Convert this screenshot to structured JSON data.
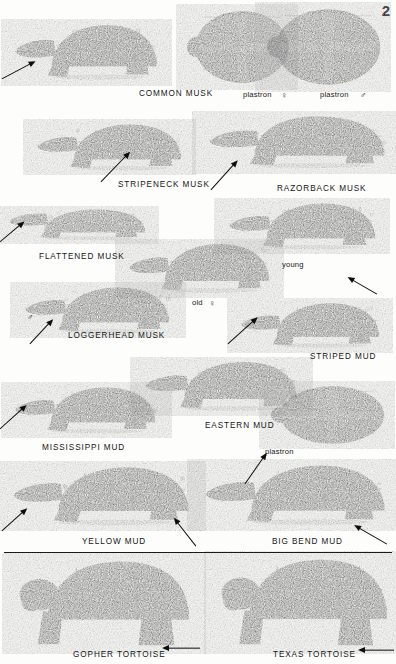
{
  "plate": {
    "page_number": "2",
    "background_color": "#fdfdfb",
    "ink_color": "#161616",
    "divider_color": "#1a1a1a"
  },
  "labels": [
    {
      "id": "common-musk",
      "text": "COMMON MUSK",
      "x": 139,
      "y": 89,
      "kind": "species"
    },
    {
      "id": "plastron-female-1",
      "text": "plastron",
      "x": 243,
      "y": 90,
      "kind": "minor"
    },
    {
      "id": "symbol-female-1",
      "text": "♀",
      "x": 281,
      "y": 90,
      "kind": "symbol"
    },
    {
      "id": "plastron-male-1",
      "text": "plastron",
      "x": 320,
      "y": 90,
      "kind": "minor"
    },
    {
      "id": "symbol-male-1",
      "text": "♂",
      "x": 360,
      "y": 90,
      "kind": "symbol"
    },
    {
      "id": "stripeneck-musk",
      "text": "STRIPENECK MUSK",
      "x": 118,
      "y": 180,
      "kind": "species"
    },
    {
      "id": "razorback-musk",
      "text": "RAZORBACK MUSK",
      "x": 277,
      "y": 184,
      "kind": "species"
    },
    {
      "id": "flattened-musk",
      "text": "FLATTENED MUSK",
      "x": 39,
      "y": 252,
      "kind": "species"
    },
    {
      "id": "young",
      "text": "young",
      "x": 282,
      "y": 260,
      "kind": "minor"
    },
    {
      "id": "symbol-male-2",
      "text": "♂",
      "x": 27,
      "y": 312,
      "kind": "symbol"
    },
    {
      "id": "old-female",
      "text": "old",
      "x": 192,
      "y": 298,
      "kind": "minor"
    },
    {
      "id": "symbol-female-2",
      "text": "♀",
      "x": 209,
      "y": 298,
      "kind": "symbol"
    },
    {
      "id": "loggerhead-musk",
      "text": "LOGGERHEAD MUSK",
      "x": 68,
      "y": 331,
      "kind": "species"
    },
    {
      "id": "striped-mud",
      "text": "STRIPED MUD",
      "x": 310,
      "y": 352,
      "kind": "species"
    },
    {
      "id": "eastern-mud",
      "text": "EASTERN MUD",
      "x": 205,
      "y": 421,
      "kind": "species"
    },
    {
      "id": "mississippi-mud",
      "text": "MISSISSIPPI MUD",
      "x": 42,
      "y": 443,
      "kind": "species"
    },
    {
      "id": "plastron-2",
      "text": "plastron",
      "x": 265,
      "y": 447,
      "kind": "minor"
    },
    {
      "id": "yellow-mud",
      "text": "YELLOW MUD",
      "x": 82,
      "y": 537,
      "kind": "species"
    },
    {
      "id": "big-bend-mud",
      "text": "BIG BEND MUD",
      "x": 272,
      "y": 537,
      "kind": "species"
    },
    {
      "id": "gopher-tortoise",
      "text": "GOPHER TORTOISE",
      "x": 73,
      "y": 650,
      "kind": "species"
    },
    {
      "id": "texas-tortoise",
      "text": "TEXAS TORTOISE",
      "x": 273,
      "y": 650,
      "kind": "species"
    }
  ],
  "divider": {
    "y": 552
  },
  "arrows": [
    {
      "id": "arrow-common-musk-head",
      "x": 2,
      "y": 75,
      "len": 38,
      "angle": -28
    },
    {
      "id": "arrow-stripeneck-neck",
      "x": 101,
      "y": 178,
      "len": 42,
      "angle": -46
    },
    {
      "id": "arrow-razorback-head",
      "x": 211,
      "y": 186,
      "len": 40,
      "angle": -48
    },
    {
      "id": "arrow-flattened-head",
      "x": 0,
      "y": 238,
      "len": 32,
      "angle": -40
    },
    {
      "id": "arrow-loggerhead-head",
      "x": 30,
      "y": 340,
      "len": 34,
      "angle": -47
    },
    {
      "id": "arrow-striped-mud-head",
      "x": 228,
      "y": 340,
      "len": 40,
      "angle": -42
    },
    {
      "id": "arrow-young-shell",
      "x": 377,
      "y": 290,
      "len": 34,
      "angle": -150
    },
    {
      "id": "arrow-mississippi-head",
      "x": 0,
      "y": 425,
      "len": 36,
      "angle": -42
    },
    {
      "id": "arrow-eastern-plastron",
      "x": 245,
      "y": 480,
      "len": 38,
      "angle": -55
    },
    {
      "id": "arrow-yellow-head",
      "x": 2,
      "y": 527,
      "len": 34,
      "angle": -42
    },
    {
      "id": "arrow-yellow-marginal",
      "x": 196,
      "y": 542,
      "len": 36,
      "angle": -128
    },
    {
      "id": "arrow-bigbend-marginal",
      "x": 387,
      "y": 540,
      "len": 38,
      "angle": -150
    },
    {
      "id": "arrow-gopher-foot",
      "x": 200,
      "y": 644,
      "len": 38,
      "angle": 180
    },
    {
      "id": "arrow-texas-foot",
      "x": 394,
      "y": 646,
      "len": 36,
      "angle": 180
    }
  ],
  "specimens": [
    {
      "id": "common-musk",
      "name": "common-musk-turtle",
      "view": "side-left",
      "x": 14,
      "y": 16,
      "w": 146,
      "h": 74,
      "tone": "#2b2b2b"
    },
    {
      "id": "plastron-female",
      "name": "common-musk-plastron-female",
      "view": "plastron",
      "x": 188,
      "y": 8,
      "w": 104,
      "h": 78,
      "tone": "#4b4b4b"
    },
    {
      "id": "plastron-male",
      "name": "common-musk-plastron-male",
      "view": "plastron",
      "x": 268,
      "y": 6,
      "w": 116,
      "h": 82,
      "tone": "#4b4b4b"
    },
    {
      "id": "stripeneck-musk",
      "name": "stripeneck-musk-turtle",
      "view": "side-left",
      "x": 36,
      "y": 117,
      "w": 148,
      "h": 62,
      "tone": "#333"
    },
    {
      "id": "razorback-musk",
      "name": "razorback-musk-turtle",
      "view": "side-left-keel",
      "x": 208,
      "y": 112,
      "w": 180,
      "h": 70,
      "tone": "#3a3a3a"
    },
    {
      "id": "flattened-musk",
      "name": "flattened-musk-turtle",
      "view": "side-left-flat",
      "x": 8,
      "y": 198,
      "w": 140,
      "h": 52,
      "tone": "#5a5a5a"
    },
    {
      "id": "loggerhead-young",
      "name": "loggerhead-musk-young",
      "view": "side-left",
      "x": 228,
      "y": 196,
      "w": 150,
      "h": 62,
      "tone": "#2e2e2e"
    },
    {
      "id": "loggerhead-old",
      "name": "loggerhead-musk-old-female",
      "view": "side-left",
      "x": 128,
      "y": 236,
      "w": 144,
      "h": 66,
      "tone": "#272727"
    },
    {
      "id": "loggerhead-male",
      "name": "loggerhead-musk-male",
      "view": "side-left",
      "x": 24,
      "y": 280,
      "w": 148,
      "h": 62,
      "tone": "#262626"
    },
    {
      "id": "striped-mud",
      "name": "striped-mud-turtle",
      "view": "side-left",
      "x": 240,
      "y": 296,
      "w": 142,
      "h": 60,
      "tone": "#1f1f1f"
    },
    {
      "id": "eastern-mud",
      "name": "eastern-mud-turtle",
      "view": "side-left",
      "x": 144,
      "y": 354,
      "w": 156,
      "h": 66,
      "tone": "#222"
    },
    {
      "id": "eastern-plastron",
      "name": "eastern-mud-plastron",
      "view": "plastron",
      "x": 272,
      "y": 384,
      "w": 116,
      "h": 62,
      "tone": "#4a4a4a"
    },
    {
      "id": "mississippi-mud",
      "name": "mississippi-mud-turtle",
      "view": "side-left",
      "x": 14,
      "y": 380,
      "w": 144,
      "h": 62,
      "tone": "#232323"
    },
    {
      "id": "yellow-mud",
      "name": "yellow-mud-turtle",
      "view": "side-left",
      "x": 12,
      "y": 458,
      "w": 180,
      "h": 78,
      "tone": "#343434"
    },
    {
      "id": "big-bend-mud",
      "name": "big-bend-mud-turtle",
      "view": "side-left",
      "x": 204,
      "y": 456,
      "w": 184,
      "h": 80,
      "tone": "#2c2c2c"
    },
    {
      "id": "gopher-tortoise",
      "name": "gopher-tortoise",
      "view": "tortoise",
      "x": 16,
      "y": 556,
      "w": 180,
      "h": 92,
      "tone": "#3d3d3d"
    },
    {
      "id": "texas-tortoise",
      "name": "texas-tortoise",
      "view": "tortoise",
      "x": 218,
      "y": 554,
      "w": 176,
      "h": 94,
      "tone": "#363636"
    }
  ]
}
